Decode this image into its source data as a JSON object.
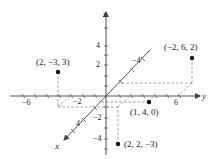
{
  "diagram": {
    "axes": {
      "x": {
        "name": "x",
        "ticks": [
          "-4",
          "4"
        ]
      },
      "y": {
        "name": "y",
        "ticks": [
          "-6",
          "-2",
          "6"
        ]
      },
      "z": {
        "name": "z",
        "ticks": [
          "4",
          "2",
          "-2",
          "-4"
        ]
      }
    },
    "points": [
      {
        "label": "(2, −3, 3)",
        "coords": [
          2,
          -3,
          3
        ]
      },
      {
        "label": "(−2, 6, 2)",
        "coords": [
          -2,
          6,
          2
        ]
      },
      {
        "label": "(1, 4, 0)",
        "coords": [
          1,
          4,
          0
        ]
      },
      {
        "label": "(2, 2, −3)",
        "coords": [
          2,
          2,
          -3
        ]
      }
    ],
    "tick_labels": {
      "z_4": "4",
      "z_2": "2",
      "z_neg2": "−2",
      "z_neg4": "−4",
      "y_neg6": "−6",
      "y_neg2": "−2",
      "y_6": "6",
      "x_neg4": "−4",
      "x_4": "4"
    },
    "colors": {
      "axis": "#555555",
      "point": "#111111",
      "dashed": "#777777"
    }
  }
}
